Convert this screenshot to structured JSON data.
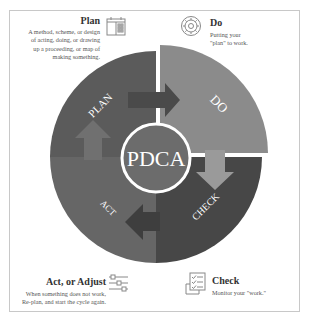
{
  "plan": {
    "title": "Plan",
    "description_lines": [
      "A method, scheme, or design",
      "of acting, doing, or drawing",
      "up a proceeding, or map of",
      "making something."
    ],
    "icon": "calendar-icon"
  },
  "do": {
    "title": "Do",
    "description_lines": [
      "Putting your",
      "\"plan\" to work."
    ],
    "icon": "gear-icon"
  },
  "check": {
    "title": "Check",
    "description_lines": [
      "Monitor your \"work.\""
    ],
    "icon": "checklist-icon"
  },
  "act": {
    "title": "Act, or Adjust",
    "description_lines": [
      "When something does not work,",
      "Re-plan, and start the cycle again."
    ],
    "icon": "sliders-icon"
  },
  "cycle": {
    "center_label": "PDCA",
    "segments": [
      {
        "label": "PLAN",
        "color": "#5b5b5b"
      },
      {
        "label": "DO",
        "color": "#8b8b8b"
      },
      {
        "label": "CHECK",
        "color": "#474747"
      },
      {
        "label": "ACT",
        "color": "#6a6a6a"
      }
    ],
    "center_color": "#6c6c6c",
    "ring_color": "#ffffff"
  }
}
